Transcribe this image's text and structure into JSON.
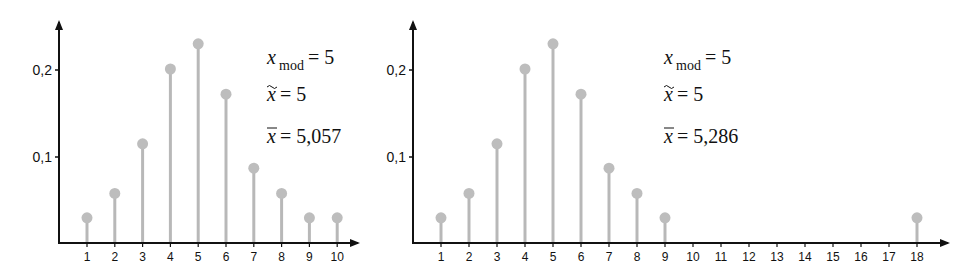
{
  "chart_data": [
    {
      "type": "stem",
      "title": "",
      "xlabel": "",
      "ylabel": "",
      "categories": [
        "1",
        "2",
        "3",
        "4",
        "5",
        "6",
        "7",
        "8",
        "9",
        "10"
      ],
      "x": [
        1,
        2,
        3,
        4,
        5,
        6,
        7,
        8,
        9,
        10
      ],
      "values": [
        0.029,
        0.057,
        0.114,
        0.2,
        0.229,
        0.171,
        0.086,
        0.057,
        0.029,
        0.029
      ],
      "yticks": [
        "0,1",
        "0,2"
      ],
      "ytick_values": [
        0.1,
        0.2
      ],
      "ylim": [
        0,
        0.26
      ],
      "xlim": [
        0,
        10.8
      ],
      "grid": false,
      "annotations": [
        {
          "label": "x_mod",
          "value": "5"
        },
        {
          "label": "x̃ (median)",
          "value": "5"
        },
        {
          "label": "x̄ (mean)",
          "value": "5,057"
        }
      ]
    },
    {
      "type": "stem",
      "title": "",
      "xlabel": "",
      "ylabel": "",
      "categories": [
        "1",
        "2",
        "3",
        "4",
        "5",
        "6",
        "7",
        "8",
        "9",
        "10",
        "11",
        "12",
        "13",
        "14",
        "15",
        "16",
        "17",
        "18"
      ],
      "x": [
        1,
        2,
        3,
        4,
        5,
        6,
        7,
        8,
        9,
        18
      ],
      "values": [
        0.029,
        0.057,
        0.114,
        0.2,
        0.229,
        0.171,
        0.086,
        0.057,
        0.029,
        0.029
      ],
      "yticks": [
        "0,1",
        "0,2"
      ],
      "ytick_values": [
        0.1,
        0.2
      ],
      "ylim": [
        0,
        0.26
      ],
      "xlim": [
        0,
        19
      ],
      "grid": false,
      "annotations": [
        {
          "label": "x_mod",
          "value": "5"
        },
        {
          "label": "x̃ (median)",
          "value": "5"
        },
        {
          "label": "x̄ (mean)",
          "value": "5,286"
        }
      ]
    }
  ],
  "left": {
    "yticks": [
      "0,2",
      "0,1"
    ],
    "xticks": [
      "1",
      "2",
      "3",
      "4",
      "5",
      "6",
      "7",
      "8",
      "9",
      "10"
    ],
    "stats": {
      "mod_sym": "x",
      "mod_sub": "mod",
      "mod_val": "= 5",
      "median_sym": "x",
      "median_val": "= 5",
      "mean_sym": "x",
      "mean_val": "= 5,057"
    }
  },
  "right": {
    "yticks": [
      "0,2",
      "0,1"
    ],
    "xticks": [
      "1",
      "2",
      "3",
      "4",
      "5",
      "6",
      "7",
      "8",
      "9",
      "10",
      "11",
      "12",
      "13",
      "14",
      "15",
      "16",
      "17",
      "18"
    ],
    "stats": {
      "mod_sym": "x",
      "mod_sub": "mod",
      "mod_val": "= 5",
      "median_sym": "x",
      "median_val": "= 5",
      "mean_sym": "x",
      "mean_val": "= 5,286"
    }
  },
  "colors": {
    "stem": "#b8b8b8",
    "marker": "#bdbdbd",
    "axis": "#111111"
  }
}
